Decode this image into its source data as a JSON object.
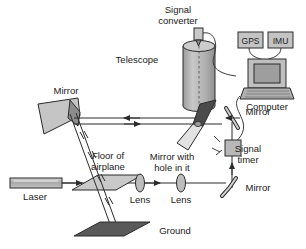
{
  "figure": {
    "background_color": "#ffffff",
    "line_color": "#2b2b2b"
  },
  "labels": {
    "signal_converter": "Signal\nconverter",
    "signal_converter_line1": "Signal",
    "signal_converter_line2": "converter",
    "telescope": "Telescope",
    "gps": "GPS",
    "imu": "IMU",
    "computer": "Computer",
    "mirror_top_left": "Mirror",
    "mirror_right_upper": "Mirror",
    "mirror_right_lower": "Mirror",
    "mirror_with_hole_line1": "Mirror with",
    "mirror_with_hole_line2": "hole in it",
    "signal_timer_line1": "Signal",
    "signal_timer_line2": "timer",
    "floor_line1": "Floor of",
    "floor_line2": "airplane",
    "laser": "Laser",
    "lens_left": "Lens",
    "lens_right": "Lens",
    "ground": "Ground"
  },
  "components": {
    "laser": {
      "name": "Laser",
      "shape": "rectangle",
      "fill": "#b5b5b5"
    },
    "floor_of_airplane": {
      "name": "Floor of airplane",
      "shape": "parallelogram",
      "fill": "#c9c9c9"
    },
    "lens_left": {
      "name": "Lens",
      "shape": "ellipse",
      "fill": "#bdbdbd"
    },
    "lens_right": {
      "name": "Lens",
      "shape": "ellipse",
      "fill": "#bdbdbd"
    },
    "mirror_lower_right": {
      "name": "Mirror",
      "shape": "curved-bar",
      "fill": "#d0d0d0"
    },
    "signal_timer": {
      "name": "Signal timer",
      "shape": "square",
      "fill": "#b8b8b8"
    },
    "mirror_upper_right": {
      "name": "Mirror",
      "shape": "diagonal-bar",
      "fill": "#d0d0d0"
    },
    "mirror_with_hole": {
      "name": "Mirror with hole in it",
      "shape": "bowtie",
      "fill_dark": "#4a4a4a",
      "fill_light": "#e0e0e0"
    },
    "scanning_mirror": {
      "name": "Mirror",
      "shape": "quadrilateral",
      "fill": "#c5c5c5"
    },
    "telescope": {
      "name": "Telescope",
      "shape": "cylinder",
      "fill": "#b9b9b9"
    },
    "signal_converter": {
      "name": "Signal converter",
      "shape": "small-box",
      "fill": "#c8c8c8"
    },
    "gps": {
      "name": "GPS",
      "shape": "box",
      "fill": "#c4c4c4"
    },
    "imu": {
      "name": "IMU",
      "shape": "box",
      "fill": "#c4c4c4"
    },
    "computer": {
      "name": "Computer",
      "shape": "laptop",
      "fill": "#bfbfbf"
    },
    "ground": {
      "name": "Ground",
      "shape": "parallelogram",
      "fill": "#595959"
    }
  },
  "beam_paths": {
    "outbound_direction": "right-to-left along upper horizontal, then down through floor to ground",
    "return_direction": "ground up to scanning mirror, then right to telescope",
    "arrows": [
      {
        "id": "laser-out",
        "direction": "right"
      },
      {
        "id": "upper-beam-left",
        "direction": "left"
      },
      {
        "id": "upper-beam-right",
        "direction": "right"
      },
      {
        "id": "lens-to-lens",
        "direction": "right"
      },
      {
        "id": "telescope-down",
        "direction": "down"
      },
      {
        "id": "to-timer-up",
        "direction": "up"
      },
      {
        "id": "mirror-right-in",
        "direction": "left"
      }
    ]
  }
}
